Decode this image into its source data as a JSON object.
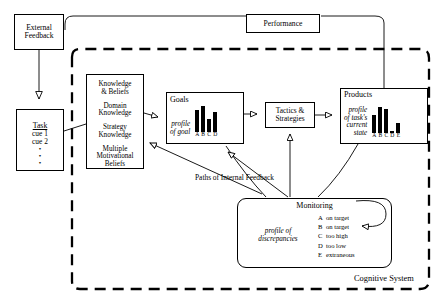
{
  "diagram": {
    "boundary_label": "Cognitive System",
    "paths_label": "Paths of Internal Feedback",
    "stroke_color": "#000000",
    "background_color": "#ffffff"
  },
  "nodes": {
    "external_feedback": {
      "label": "External\nFeedback",
      "line1": "External",
      "line2": "Feedback"
    },
    "performance": {
      "label": "Performance"
    },
    "task": {
      "title": "Task",
      "cues": [
        "cue 1",
        "cue 2"
      ],
      "ellipsis": "•"
    },
    "knowledge": {
      "items": [
        "Knowledge\n& Beliefs",
        "Domain\nKnowledge",
        "Strategy\nKnowledge",
        "Multiple\nMotivational\nBeliefs"
      ],
      "item0_line1": "Knowledge",
      "item0_line2": "& Beliefs",
      "item1_line1": "Domain",
      "item1_line2": "Knowledge",
      "item2_line1": "Strategy",
      "item2_line2": "Knowledge",
      "item3_line1": "Multiple",
      "item3_line2": "Motivational",
      "item3_line3": "Beliefs"
    },
    "goals": {
      "title": "Goals",
      "profile_line1": "profile",
      "profile_line2": "of goal"
    },
    "tactics": {
      "line1": "Tactics &",
      "line2": "Strategies"
    },
    "products": {
      "title": "Products",
      "profile_line1": "profile",
      "profile_line2": "of task's",
      "profile_line3": "current",
      "profile_line4": "state"
    },
    "monitoring": {
      "title": "Monitoring",
      "profile_line1": "profile of",
      "profile_line2": "discrepancies",
      "rows": [
        {
          "key": "A",
          "value": "on target"
        },
        {
          "key": "B",
          "value": "on target"
        },
        {
          "key": "C",
          "value": "too high"
        },
        {
          "key": "D",
          "value": "too low"
        },
        {
          "key": "E",
          "value": "extraneous"
        }
      ]
    }
  },
  "chart_data": [
    {
      "type": "bar",
      "title": "Goals",
      "subtitle": "profile of goal",
      "categories": [
        "A",
        "B",
        "C",
        "D"
      ],
      "values": [
        22,
        28,
        13,
        20
      ],
      "ylim": [
        0,
        32
      ],
      "xlabel": "",
      "ylabel": "",
      "grid": false,
      "legend": "none"
    },
    {
      "type": "bar",
      "title": "Products",
      "subtitle": "profile of task's current state",
      "categories": [
        "A",
        "B",
        "C",
        "D",
        "E"
      ],
      "values": [
        18,
        27,
        24,
        2,
        10
      ],
      "ylim": [
        0,
        32
      ],
      "xlabel": "",
      "ylabel": "",
      "grid": false,
      "legend": "none"
    }
  ],
  "goals_bars": [
    {
      "label": "A",
      "height": 22
    },
    {
      "label": "B",
      "height": 28
    },
    {
      "label": "C",
      "height": 13
    },
    {
      "label": "D",
      "height": 20
    }
  ],
  "products_bars": [
    {
      "label": "A",
      "height": 18
    },
    {
      "label": "B",
      "height": 27
    },
    {
      "label": "C",
      "height": 24
    },
    {
      "label": "D",
      "height": 2
    },
    {
      "label": "E",
      "height": 10
    }
  ]
}
